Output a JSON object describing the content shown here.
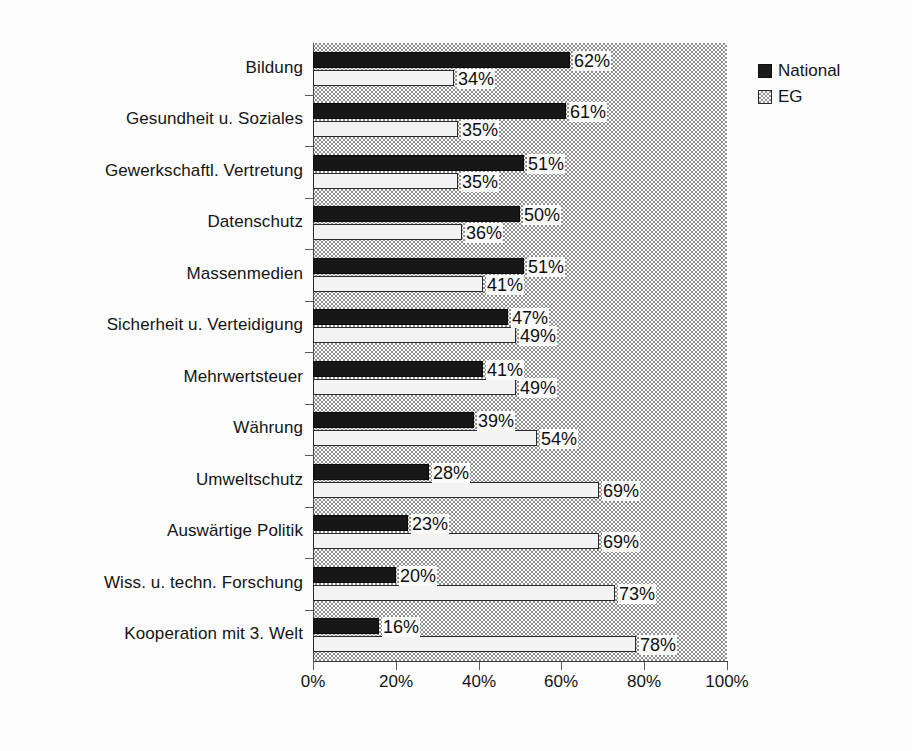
{
  "chart_data": {
    "type": "bar",
    "orientation": "horizontal",
    "title": "",
    "subtitle": "",
    "xlabel": "",
    "ylabel": "",
    "xlim": [
      0,
      100
    ],
    "xticks": [
      "0%",
      "20%",
      "40%",
      "60%",
      "80%",
      "100%"
    ],
    "xtick_values": [
      0,
      20,
      40,
      60,
      80,
      100
    ],
    "grid": false,
    "legend_position": "top-right",
    "value_suffix": "%",
    "categories": [
      "Bildung",
      "Gesundheit u. Soziales",
      "Gewerkschaftl. Vertretung",
      "Datenschutz",
      "Massenmedien",
      "Sicherheit u. Verteidigung",
      "Mehrwertsteuer",
      "Währung",
      "Umweltschutz",
      "Auswärtige Politik",
      "Wiss. u. techn. Forschung",
      "Kooperation mit 3. Welt"
    ],
    "series": [
      {
        "name": "National",
        "color": "#171717",
        "values": [
          62,
          61,
          51,
          50,
          51,
          47,
          41,
          39,
          28,
          23,
          20,
          16
        ],
        "labels": [
          "62%",
          "61%",
          "51%",
          "50%",
          "51%",
          "47%",
          "41%",
          "39%",
          "28%",
          "23%",
          "20%",
          "16%"
        ]
      },
      {
        "name": "EG",
        "color": "#f3f3f3",
        "values": [
          34,
          35,
          35,
          36,
          41,
          49,
          49,
          54,
          69,
          69,
          73,
          78
        ],
        "labels": [
          "34%",
          "35%",
          "35%",
          "36%",
          "41%",
          "49%",
          "49%",
          "54%",
          "69%",
          "69%",
          "73%",
          "78%"
        ]
      }
    ]
  },
  "legend": {
    "items": [
      {
        "label": "National",
        "swatch": "national"
      },
      {
        "label": "EG",
        "swatch": "eg"
      }
    ]
  }
}
